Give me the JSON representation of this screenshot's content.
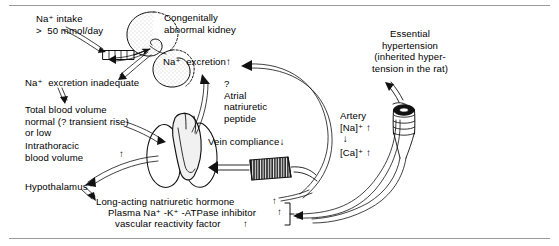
{
  "figure": {
    "width": 559,
    "height": 246,
    "background": "#ffffff",
    "rule_color": "#9a9a9a",
    "ink_color": "#000000"
  },
  "labels": {
    "na_intake": "Na⁺ intake\n>  50 mmol/day",
    "congenital_kidney": "Congenitally\nabnormal kidney",
    "na_excretion": "Na⁺  excretion",
    "na_excretion_arrow": "↑",
    "na_excretion_inadequate": "Na⁺  excretion inadequate",
    "total_blood_volume": "Total blood volume\nnormal (? transient rise)\nor low",
    "intrathoracic_blood_volume": "Intrathoracic\nblood volume",
    "intrathoracic_arrow": "↑",
    "hypothalamus": "Hypothalamus",
    "question_mark": "?",
    "atrial_natriuretic_peptide": "Atrial\nnatriuretic\npeptide",
    "vein_compliance": "Vein compliance",
    "vein_compliance_arrow": "↓",
    "essential_hypertension": "Essential\nhypertension\n(inherited hyper-\ntension in the rat)",
    "artery": "Artery",
    "artery_na": "[Na]⁺",
    "artery_na_arrow": "↑",
    "artery_link_arrow": "↓",
    "artery_ca": "[Ca]⁺",
    "artery_ca_arrow": "↑",
    "long_acting_hormone": "Long-acting natriuretic hormone",
    "long_acting_hormone_arrow": "↑",
    "plasma_atpase_inhibitor": "Plasma Na⁺ -K⁺ -ATPase inhibitor",
    "plasma_atpase_inhibitor_arrow": "↑",
    "vascular_reactivity_factor": "vascular reactivity factor",
    "vascular_reactivity_factor_arrow": "↑"
  },
  "anatomy": {
    "kidney_upper": "congenitally-abnormal-kidney-upper",
    "kidney_lower": "congenitally-abnormal-kidney-lower",
    "gut_tube": "striated-gut-tube",
    "heart_lungs": "heart-and-lungs",
    "vein_segment": "striated-vein-segment",
    "artery_segment": "coiled-artery-segment"
  },
  "connectors": [
    {
      "name": "na-intake-to-gut",
      "from": "na_intake",
      "to": "gut_tube"
    },
    {
      "name": "gut-to-na-inadequate",
      "from": "gut_tube",
      "to": "na_excretion_inadequate"
    },
    {
      "name": "na-inadequate-to-total-blood-volume",
      "from": "na_excretion_inadequate",
      "to": "total_blood_volume"
    },
    {
      "name": "total-blood-volume-to-heart",
      "from": "total_blood_volume",
      "to": "heart_lungs"
    },
    {
      "name": "heart-to-hypothalamus",
      "from": "heart_lungs",
      "to": "hypothalamus"
    },
    {
      "name": "hypothalamus-to-hormones",
      "from": "hypothalamus",
      "to": "long_acting_hormone"
    },
    {
      "name": "heart-to-na-excretion",
      "from": "heart_lungs",
      "to": "na_excretion"
    },
    {
      "name": "hormones-to-na-excretion",
      "from": "long_acting_hormone",
      "to": "na_excretion"
    },
    {
      "name": "hormones-to-artery",
      "from": "plasma_atpase_inhibitor",
      "to": "artery_segment"
    },
    {
      "name": "vein-to-heart",
      "from": "vein_segment",
      "to": "heart_lungs"
    },
    {
      "name": "artery-to-essential-hypertension",
      "from": "artery_segment",
      "to": "essential_hypertension"
    }
  ]
}
